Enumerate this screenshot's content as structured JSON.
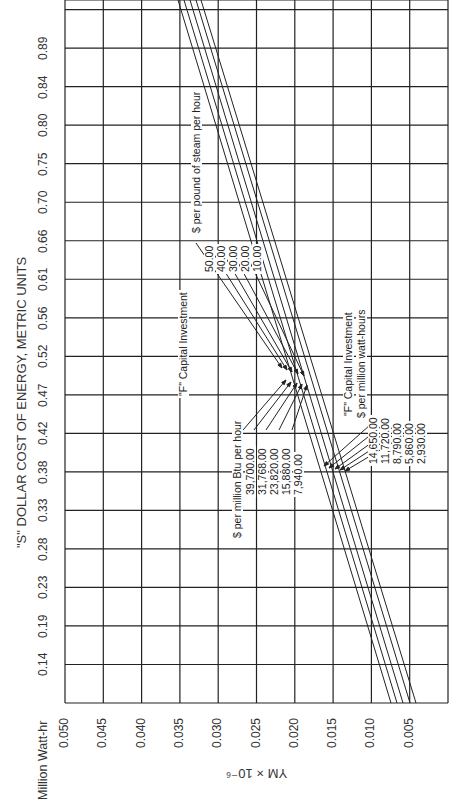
{
  "chart_data": {
    "type": "line",
    "orientation": "rotated 90 degrees counter-clockwise",
    "title": "\"S\" DOLLAR COST OF ENERGY, METRIC UNITS",
    "xlabel": "Million Watt-hr",
    "ylabel": "YM × 10⁻⁶",
    "x_tick_labels": [
      "0.14",
      "0.19",
      "0.23",
      "0.28",
      "0.33",
      "0.38",
      "0.42",
      "0.47",
      "0.52",
      "0.56",
      "0.61",
      "0.66",
      "0.70",
      "0.75",
      "0.80",
      "0.84",
      "0.89"
    ],
    "y_tick_labels": [
      "0.050",
      "0.045",
      "0.040",
      "0.035",
      "0.030",
      "0.025",
      "0.020",
      "0.015",
      "0.010",
      "0.005"
    ],
    "ylim": [
      0.0,
      0.05
    ],
    "grid": true,
    "series": [
      {
        "name": "F = 39,700.00 $/million Btu per hour (50.00 $/lb steam per hour; 14,650.00 $/million watt-hours)"
      },
      {
        "name": "F = 31,768.00 (40.00; 11,720.00)"
      },
      {
        "name": "F = 23,820.00 (30.00; 8,790.00)"
      },
      {
        "name": "F = 15,880.00 (20.00; 5,860.00)"
      },
      {
        "name": "F = 7,940.00 (10.00; 2,930.00)"
      }
    ],
    "annotations": {
      "steam": {
        "title": "\"F\" Capital Investment",
        "unit": "$ per pound of steam per hour",
        "values": [
          "50.00",
          "40.00",
          "30.00",
          "20.00",
          "10.00"
        ]
      },
      "btu": {
        "unit": "$ per million Btu per hour",
        "values": [
          "39,700.00",
          "31,768.00",
          "23,820.00",
          "15,880.00",
          "7,940.00"
        ]
      },
      "watt": {
        "title": "\"F\" Capital Investment",
        "unit": "$ per million watt-hours",
        "values": [
          "14,650.00",
          "11,720.00",
          "8,790.00",
          "5,860.00",
          "2,930.00"
        ]
      }
    }
  },
  "colors": {
    "ink": "#222222",
    "background": "#ffffff"
  }
}
